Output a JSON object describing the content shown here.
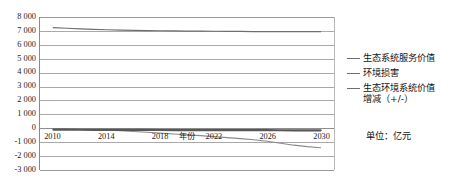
{
  "chart_data": {
    "type": "line",
    "title": "",
    "xlabel": "年份",
    "ylabel": "",
    "unit_note": "单位：亿元",
    "x": [
      2010,
      2011,
      2012,
      2013,
      2014,
      2015,
      2016,
      2017,
      2018,
      2019,
      2020,
      2021,
      2022,
      2023,
      2024,
      2025,
      2026,
      2027,
      2028,
      2029,
      2030
    ],
    "xlim": [
      2009,
      2031
    ],
    "ylim": [
      -3000,
      8000
    ],
    "grid": true,
    "legend_position": "right",
    "xticks": [
      "2010",
      "2014",
      "2018",
      "2022",
      "2026",
      "2030"
    ],
    "xtick_values": [
      2010,
      2014,
      2018,
      2022,
      2026,
      2030
    ],
    "yticks": [
      "8 000",
      "7 000",
      "6 000",
      "5 000",
      "4 000",
      "3 000",
      "2 000",
      "1 000",
      "0",
      "-1 000",
      "-2 000",
      "-3 000"
    ],
    "ytick_values": [
      8000,
      7000,
      6000,
      5000,
      4000,
      3000,
      2000,
      1000,
      0,
      -1000,
      -2000,
      -3000
    ],
    "series": [
      {
        "name": "生态系统服务价值",
        "color": "#6f6f6f",
        "width": 1.2,
        "values": [
          7230,
          7190,
          7150,
          7115,
          7085,
          7060,
          7040,
          7025,
          7010,
          7000,
          6990,
          6980,
          6975,
          6968,
          6960,
          6952,
          6945,
          6948,
          6952,
          6950,
          6948
        ]
      },
      {
        "name": "环境损害",
        "color": "#8a8a8a",
        "width": 1.1,
        "values": [
          -40,
          -55,
          -75,
          -100,
          -130,
          -175,
          -230,
          -290,
          -350,
          -410,
          -470,
          -530,
          -600,
          -670,
          -745,
          -830,
          -930,
          -1080,
          -1215,
          -1320,
          -1395
        ]
      },
      {
        "name": "生态环境系统价值\n增减（+/-）",
        "color": "#575757",
        "width": 2.2,
        "values": [
          -95,
          -100,
          -105,
          -110,
          -115,
          -118,
          -120,
          -122,
          -124,
          -126,
          -128,
          -130,
          -132,
          -134,
          -136,
          -138,
          -140,
          -142,
          -144,
          -146,
          -148
        ]
      }
    ],
    "legend": [
      {
        "label": "生态系统服务价值",
        "label2": ""
      },
      {
        "label": "环境损害",
        "label2": ""
      },
      {
        "label": "生态环境系统价值",
        "label2": "增减（+/-）"
      }
    ]
  },
  "colors": {
    "grid": "#a9a9a9",
    "axis": "#8a8a8a",
    "text": "#1c1c1c",
    "background": "#ffffff"
  }
}
